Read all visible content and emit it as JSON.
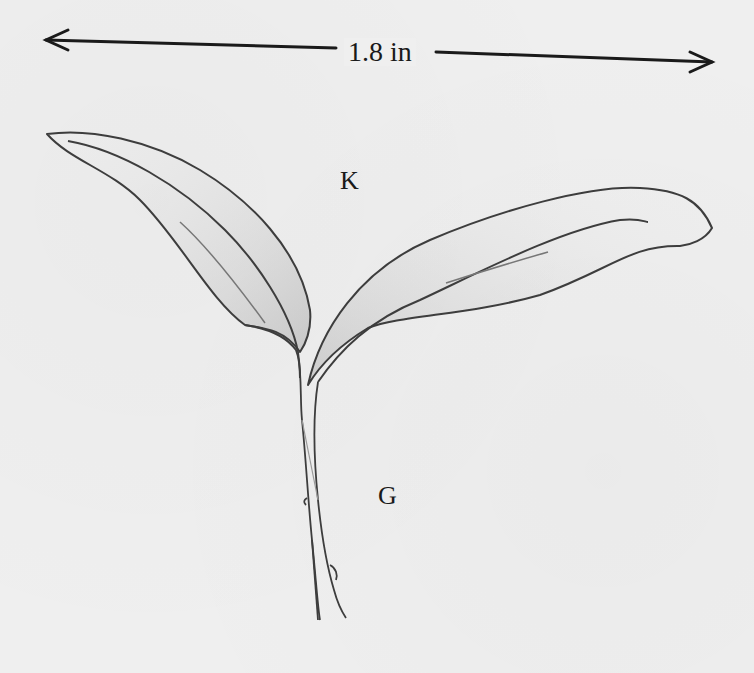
{
  "figure": {
    "type": "botanical-illustration",
    "scale_bar": {
      "label": "1.8 in",
      "direction": "horizontal double-headed arrow"
    },
    "labels": {
      "cotyledon": "K",
      "hypocotyl": "G"
    },
    "colors": {
      "background": "#efefef",
      "line": "#3a3a3a",
      "shading": "#b5b5b5"
    }
  }
}
